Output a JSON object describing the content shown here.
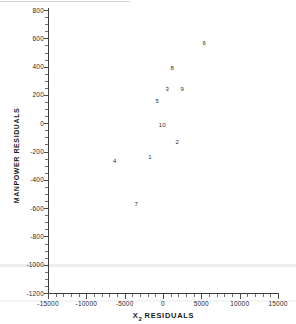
{
  "chart_data": {
    "type": "scatter",
    "title": "",
    "xlabel": "X 2 RESIDUALS",
    "xlabel_base": "X",
    "xlabel_sub": "2",
    "xlabel_rest": "RESIDUALS",
    "ylabel": "MANPOWER RESIDUALS",
    "xlim": [
      -15000,
      15000
    ],
    "ylim": [
      -1200,
      800
    ],
    "grid": false,
    "legend": "none",
    "xticks": [
      -15000,
      -10000,
      -5000,
      0,
      5000,
      10000,
      15000
    ],
    "xtick_labels": [
      "-15000",
      "-10000",
      "-5000",
      "0",
      "5000",
      "10000",
      "15000"
    ],
    "yticks": [
      800,
      600,
      400,
      200,
      0,
      -200,
      -400,
      -600,
      -800,
      -1000,
      -1200
    ],
    "ytick_labels": [
      "800",
      "600",
      "400",
      "200",
      "0",
      "-200",
      "-400",
      "-600",
      "-800",
      "-1000",
      "-1200"
    ],
    "x_minor_tick_step": 1000,
    "y_minor_tick_step": 50,
    "marker": "text-label",
    "points": [
      {
        "label": "6",
        "x": 5400,
        "y": 570
      },
      {
        "label": "8",
        "x": 1200,
        "y": 390
      },
      {
        "label": "3",
        "x": 550,
        "y": 240
      },
      {
        "label": "9",
        "x": 2500,
        "y": 240
      },
      {
        "label": "5",
        "x": -750,
        "y": 160
      },
      {
        "label": "10",
        "x": -100,
        "y": -10
      },
      {
        "label": "2",
        "x": 1850,
        "y": -130
      },
      {
        "label": "1",
        "x": -1700,
        "y": -240
      },
      {
        "label": "4",
        "x": -6300,
        "y": -270
      },
      {
        "label": "7",
        "x": -3500,
        "y": -570
      }
    ]
  },
  "colors": {
    "axis": "#3a3a3a",
    "text": "#2a2a2a",
    "point": "#2e2e2e",
    "background": "#ffffff"
  }
}
